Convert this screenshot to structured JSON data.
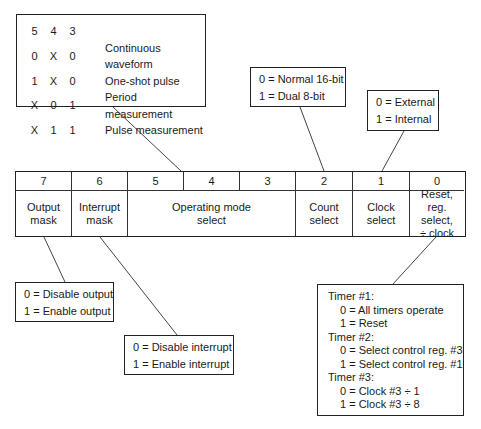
{
  "register": {
    "bits": [
      "7",
      "6",
      "5",
      "4",
      "3",
      "2",
      "1",
      "0"
    ],
    "fields": [
      {
        "name": "output-mask",
        "lines": [
          "Output",
          "mask"
        ]
      },
      {
        "name": "interrupt-mask",
        "lines": [
          "Interrupt",
          "mask"
        ]
      },
      {
        "name": "operating-mode-select",
        "lines": [
          "Operating mode",
          "select"
        ]
      },
      {
        "name": "count-select",
        "lines": [
          "Count",
          "select"
        ]
      },
      {
        "name": "clock-select",
        "lines": [
          "Clock",
          "select"
        ]
      },
      {
        "name": "reset-reg-select-clock",
        "lines": [
          "Reset,",
          "reg. select,",
          "÷ clock"
        ]
      }
    ]
  },
  "mode_table": {
    "header": [
      "5",
      "4",
      "3",
      ""
    ],
    "rows": [
      [
        "0",
        "X",
        "0",
        "Continuous waveform"
      ],
      [
        "1",
        "X",
        "0",
        "One-shot pulse"
      ],
      [
        "X",
        "0",
        "1",
        "Period measurement"
      ],
      [
        "X",
        "1",
        "1",
        "Pulse measurement"
      ]
    ]
  },
  "count_select_box": [
    "0 = Normal 16-bit",
    "1 = Dual 8-bit"
  ],
  "clock_select_box": [
    "0 = External",
    "1 = Internal"
  ],
  "output_mask_box": [
    "0 = Disable output",
    "1 = Enable output"
  ],
  "interrupt_mask_box": [
    "0 = Disable interrupt",
    "1 = Enable interrupt"
  ],
  "reset_box": {
    "lines": [
      {
        "text": "Timer #1:",
        "indent": 0
      },
      {
        "text": "0 = All timers operate",
        "indent": 1
      },
      {
        "text": "1 = Reset",
        "indent": 1
      },
      {
        "text": "Timer #2:",
        "indent": 0
      },
      {
        "text": "0 = Select control reg. #3",
        "indent": 1
      },
      {
        "text": "1 = Select control reg. #1",
        "indent": 1
      },
      {
        "text": "Timer #3:",
        "indent": 0
      },
      {
        "text": "0 = Clock #3 ÷ 1",
        "indent": 1
      },
      {
        "text": "1 = Clock #3 ÷ 8",
        "indent": 1
      }
    ]
  }
}
